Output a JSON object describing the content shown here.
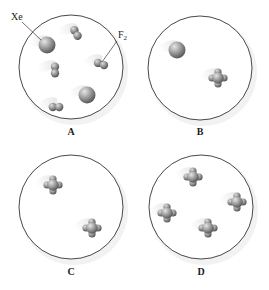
{
  "panels": [
    {
      "label": "A",
      "cx": 71,
      "cy": 67,
      "r": 52,
      "label_x": 71,
      "label_y": 135,
      "molecules": [
        {
          "type": "Xe",
          "x": 47,
          "y": 45
        },
        {
          "type": "F2",
          "x": 76,
          "y": 33,
          "angle": 60
        },
        {
          "type": "F2",
          "x": 101,
          "y": 64,
          "angle": 20
        },
        {
          "type": "F2",
          "x": 55,
          "y": 70,
          "angle": 90
        },
        {
          "type": "Xe",
          "x": 87,
          "y": 95
        },
        {
          "type": "F2",
          "x": 56,
          "y": 107,
          "angle": 0
        }
      ]
    },
    {
      "label": "B",
      "cx": 200,
      "cy": 68,
      "r": 52,
      "label_x": 200,
      "label_y": 135,
      "molecules": [
        {
          "type": "Xe",
          "x": 177,
          "y": 50
        },
        {
          "type": "XeF4",
          "x": 218,
          "y": 78
        }
      ]
    },
    {
      "label": "C",
      "cx": 71,
      "cy": 207,
      "r": 52,
      "label_x": 71,
      "label_y": 275,
      "molecules": [
        {
          "type": "XeF4",
          "x": 53,
          "y": 185
        },
        {
          "type": "XeF4",
          "x": 92,
          "y": 228
        }
      ]
    },
    {
      "label": "D",
      "cx": 201,
      "cy": 207,
      "r": 52,
      "label_x": 201,
      "label_y": 275,
      "molecules": [
        {
          "type": "XeF4",
          "x": 193,
          "y": 177
        },
        {
          "type": "XeF4",
          "x": 237,
          "y": 202
        },
        {
          "type": "XeF4",
          "x": 167,
          "y": 213
        },
        {
          "type": "XeF4",
          "x": 208,
          "y": 228
        }
      ]
    }
  ],
  "callouts": {
    "xe": {
      "text": "Xe",
      "x": 11,
      "y": 20
    },
    "f2": {
      "text": "F",
      "sub": "2",
      "x": 118,
      "y": 38
    }
  },
  "colors": {
    "circle_stroke": "#333333",
    "atom_light": "#d4d4d4",
    "atom_dark": "#6e6e6e",
    "label": "#222222"
  }
}
